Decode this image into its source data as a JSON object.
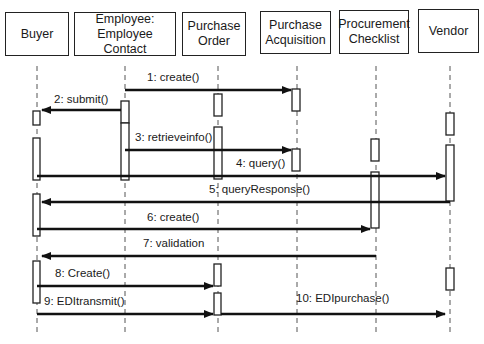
{
  "diagram": {
    "type": "UML sequence diagram",
    "objects": [
      {
        "id": "buyer",
        "label": "Buyer",
        "x": 37
      },
      {
        "id": "employee",
        "label": "Employee:\nEmployee Contact",
        "x": 125
      },
      {
        "id": "purchase_order",
        "label": "Purchase\nOrder",
        "x": 218
      },
      {
        "id": "purchase_acquisition",
        "label": "Purchase\nAcquisition",
        "x": 297
      },
      {
        "id": "procurement_checklist",
        "label": "Procurement\nChecklist",
        "x": 376
      },
      {
        "id": "vendor",
        "label": "Vendor",
        "x": 450
      }
    ],
    "messages": [
      {
        "n": 1,
        "label": "1: create()",
        "from": "employee",
        "to": "purchase_acquisition"
      },
      {
        "n": 2,
        "label": "2: submit()",
        "from": "employee",
        "to": "buyer"
      },
      {
        "n": 3,
        "label": "3: retrieveinfo()",
        "from": "employee",
        "to": "purchase_acquisition"
      },
      {
        "n": 4,
        "label": "4: query()",
        "from": "buyer",
        "to": "vendor"
      },
      {
        "n": 5,
        "label": "5: queryResponse()",
        "from": "vendor",
        "to": "buyer"
      },
      {
        "n": 6,
        "label": "6: create()",
        "from": "buyer",
        "to": "procurement_checklist"
      },
      {
        "n": 7,
        "label": "7: validation",
        "from": "procurement_checklist",
        "to": "buyer"
      },
      {
        "n": 8,
        "label": "8: Create()",
        "from": "buyer",
        "to": "purchase_order"
      },
      {
        "n": 9,
        "label": "9: EDItransmit()",
        "from": "buyer",
        "to": "purchase_order"
      },
      {
        "n": 10,
        "label": "10: EDIpurchase()",
        "from": "purchase_order",
        "to": "vendor"
      }
    ]
  }
}
